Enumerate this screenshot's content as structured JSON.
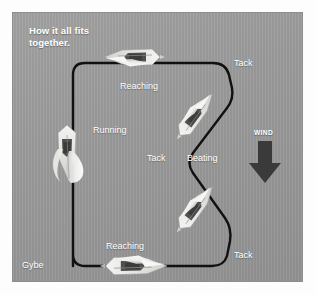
{
  "title": "How it all fits\ntogether.",
  "colors": {
    "panel_background": "#9b9b9b",
    "course_path": "#111111",
    "label_text": "#ffffff",
    "wind_arrow": "#3a3a3a",
    "sail_light": "#f2f2f0",
    "hull_dark": "#4a4a4a"
  },
  "wind": {
    "label": "WIND",
    "direction": "down",
    "arrow_icon": "down-arrow-icon"
  },
  "labels": [
    {
      "id": "reaching-top",
      "text": "Reaching",
      "x": 119,
      "y": 80
    },
    {
      "id": "tack-top-right",
      "text": "Tack",
      "x": 233,
      "y": 57
    },
    {
      "id": "running-left",
      "text": "Running",
      "x": 92,
      "y": 124
    },
    {
      "id": "tack-middle",
      "text": "Tack",
      "x": 146,
      "y": 152
    },
    {
      "id": "beating-right",
      "text": "Beating",
      "x": 186,
      "y": 152
    },
    {
      "id": "reaching-bottom",
      "text": "Reaching",
      "x": 105,
      "y": 240
    },
    {
      "id": "gybe-bottom-left",
      "text": "Gybe",
      "x": 21,
      "y": 259
    },
    {
      "id": "tack-bottom-right",
      "text": "Tack",
      "x": 233,
      "y": 249
    }
  ],
  "boats": [
    {
      "id": "boat-reaching-top",
      "point_of_sail": "Reaching",
      "x": 133,
      "y": 56,
      "rotation": 180,
      "scale": 1.0
    },
    {
      "id": "boat-beating-upper",
      "point_of_sail": "Beating",
      "x": 194,
      "y": 115,
      "rotation": -52,
      "scale": 0.95
    },
    {
      "id": "boat-running-left",
      "point_of_sail": "Running",
      "x": 66,
      "y": 148,
      "rotation": 90,
      "scale": 1.0
    },
    {
      "id": "boat-beating-lower",
      "point_of_sail": "Beating",
      "x": 194,
      "y": 208,
      "rotation": -52,
      "scale": 0.95
    },
    {
      "id": "boat-reaching-bottom",
      "point_of_sail": "Reaching",
      "x": 133,
      "y": 265,
      "rotation": 0,
      "scale": 1.1
    }
  ],
  "course": {
    "description": "Closed sailing course loop showing points of sail",
    "legs": [
      "Reaching",
      "Tack",
      "Beating",
      "Tack",
      "Reaching",
      "Gybe",
      "Running"
    ]
  }
}
